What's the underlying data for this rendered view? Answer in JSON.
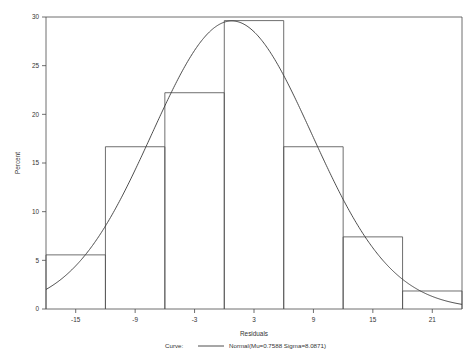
{
  "chart_data": {
    "type": "bar",
    "title": "",
    "xlabel": "Residuals",
    "ylabel": "Percent",
    "xlim": [
      -18,
      24
    ],
    "ylim": [
      0,
      30
    ],
    "grid": false,
    "bin_width": 6,
    "bin_edges": [
      -18,
      -12,
      -6,
      0,
      6,
      12,
      18,
      24
    ],
    "bin_midpoints": [
      -15,
      -9,
      -3,
      3,
      9,
      15,
      21
    ],
    "categories": [
      "-18 to -12",
      "-12 to -6",
      "-6 to 0",
      "0 to 6",
      "6 to 12",
      "12 to 18",
      "18 to 24"
    ],
    "values": [
      5.56,
      16.67,
      22.22,
      29.63,
      16.67,
      7.41,
      1.85
    ],
    "xticks": [
      -15,
      -9,
      -3,
      3,
      9,
      15,
      21
    ],
    "xtick_labels": [
      "-15",
      "-9",
      "-3",
      "3",
      "9",
      "15",
      "21"
    ],
    "yticks": [
      0,
      5,
      10,
      15,
      20,
      25,
      30
    ],
    "ytick_labels": [
      "0",
      "5",
      "10",
      "15",
      "20",
      "25",
      "30"
    ],
    "overlay_curve": {
      "kind": "normal-density",
      "mu": 0.7588,
      "sigma": 8.0871,
      "scale_percent_per_bin": 6,
      "peak_percent": 29.6
    },
    "legend": {
      "position": "below-axis",
      "label": "Curve:",
      "entries": [
        {
          "name": "Normal(Mu=0.7588 Sigma=8.0871)",
          "marker": "line"
        }
      ]
    },
    "colors": {
      "axis": "#4a4a4a",
      "bar_outline": "#555555",
      "curve": "#3a3a3a",
      "background": "#ffffff",
      "text": "#333333"
    }
  },
  "labels": {
    "x_axis_title": "Residuals",
    "y_axis_title": "Percent",
    "legend_prefix": "Curve:",
    "legend_entry": "Normal(Mu=0.7588 Sigma=8.0871)"
  }
}
